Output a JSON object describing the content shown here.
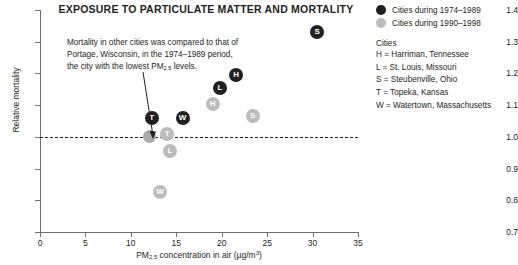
{
  "chart_data": {
    "type": "scatter",
    "title": "EXPOSURE TO PARTICULATE MATTER AND MORTALITY",
    "xlabel_prefix": "PM",
    "xlabel_sub": "2.5",
    "xlabel_suffix": " concentration in air (µg/m",
    "xlabel_sup": "3",
    "xlabel_end": ")",
    "ylabel": "Relative mortality",
    "xlim": [
      0,
      35
    ],
    "ylim": [
      0.7,
      1.4
    ],
    "xticks": [
      0,
      5,
      10,
      15,
      20,
      25,
      30,
      35
    ],
    "yticks": [
      0.7,
      0.8,
      0.9,
      1.0,
      1.1,
      1.2,
      1.3,
      1.4
    ],
    "ytick_labels": [
      "0.7",
      "0.8",
      "0.9",
      "1.0",
      "1.1",
      "1.2",
      "1.3",
      "1.4"
    ],
    "grid": false,
    "reference_line": {
      "y": 1.0,
      "style": "dashed",
      "color": "#231f20"
    },
    "colors": {
      "dark": "#231f20",
      "light": "#bcbcbc",
      "axis": "#6d6e71",
      "text": "#231f20"
    },
    "series": [
      {
        "name": "Cities during 1974–1989",
        "color": "#231f20",
        "points": [
          {
            "label": "T",
            "x": 12.3,
            "y": 1.06
          },
          {
            "label": "W",
            "x": 15.7,
            "y": 1.06
          },
          {
            "label": "L",
            "x": 19.8,
            "y": 1.155
          },
          {
            "label": "H",
            "x": 21.6,
            "y": 1.195
          },
          {
            "label": "S",
            "x": 30.5,
            "y": 1.33
          }
        ]
      },
      {
        "name": "Cities during 1990–1998",
        "color": "#bcbcbc",
        "points": [
          {
            "label": "W",
            "x": 13.2,
            "y": 0.825
          },
          {
            "label": "L",
            "x": 14.3,
            "y": 0.955
          },
          {
            "label": "T",
            "x": 14.0,
            "y": 1.01
          },
          {
            "label": "S",
            "x": 23.4,
            "y": 1.065
          },
          {
            "label": "H",
            "x": 19.0,
            "y": 1.105
          }
        ]
      },
      {
        "name": "Portage, Wisconsin reference",
        "color": "#a7a9ac",
        "points": [
          {
            "label": "",
            "x": 12.0,
            "y": 1.0
          }
        ]
      }
    ],
    "annotation": {
      "text": "Mortality in other cities was compared to that of Portage, Wisconsin, in the 1974–1989 period, the city with the lowest PM",
      "text_sub": "2.5",
      "text_end": " levels."
    }
  },
  "legend": {
    "entries": [
      {
        "label": "Cities during 1974–1989",
        "swatch": "dark"
      },
      {
        "label": "Cities during 1990–1998",
        "swatch": "light"
      }
    ],
    "cities_heading": "Cities",
    "cities": [
      "H = Harriman, Tennessee",
      "L = St. Louis, Missouri",
      "S = Steubenville, Ohio",
      "T = Topeka, Kansas",
      "W = Watertown, Massachusetts"
    ]
  }
}
